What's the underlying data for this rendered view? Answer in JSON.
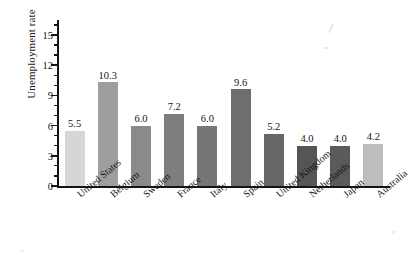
{
  "chart_data": {
    "type": "bar",
    "title": "",
    "subtitle": "",
    "xlabel": "",
    "ylabel": "Unemployment rate",
    "ylim": [
      0,
      16.5
    ],
    "ytick_labels": [
      "0",
      "3",
      "6",
      "9",
      "12",
      "15"
    ],
    "ytick_values": [
      0,
      3,
      6,
      9,
      12,
      15
    ],
    "minor_tick_step": 1,
    "grid": false,
    "legend": false,
    "legend_position": "none",
    "value_label_format": "one-decimal",
    "categories": [
      "United States",
      "Belgium",
      "Sweden",
      "France",
      "Italy",
      "Spain",
      "United Kingdom",
      "Netherlands",
      "Japan",
      "Australia"
    ],
    "values": [
      5.5,
      10.3,
      6.0,
      7.2,
      6.0,
      9.6,
      5.2,
      4.0,
      4.0,
      4.2
    ],
    "value_labels": [
      "5.5",
      "10.3",
      "6.0",
      "7.2",
      "6.0",
      "9.6",
      "5.2",
      "4.0",
      "4.0",
      "4.2"
    ],
    "bar_colors": [
      "#d6d6d6",
      "#9e9e9e",
      "#8a8a8a",
      "#7e7e7e",
      "#767676",
      "#6e6e6e",
      "#666666",
      "#555555",
      "#5a5a5a",
      "#bdbdbd"
    ],
    "axis_color": "#141414",
    "background_color": "#ffffff"
  }
}
